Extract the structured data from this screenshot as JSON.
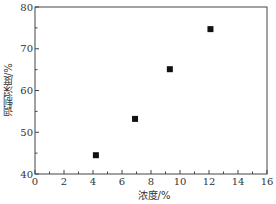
{
  "chart_data": {
    "type": "scatter",
    "title": "",
    "xlabel": "浓度/%",
    "ylabel": "调制深度/%",
    "xlim": [
      0,
      16
    ],
    "ylim": [
      40,
      80
    ],
    "x_ticks": [
      0,
      2,
      4,
      6,
      8,
      10,
      12,
      14,
      16
    ],
    "y_ticks": [
      40,
      50,
      60,
      70,
      80
    ],
    "x_minor_step": 1,
    "y_minor_step": 5,
    "grid": false,
    "legend": null,
    "marker": "square",
    "marker_color": "#111111",
    "series": [
      {
        "name": "",
        "x": [
          4.2,
          6.9,
          9.3,
          12.1
        ],
        "y": [
          44.5,
          53.2,
          65.1,
          74.7
        ]
      }
    ]
  }
}
